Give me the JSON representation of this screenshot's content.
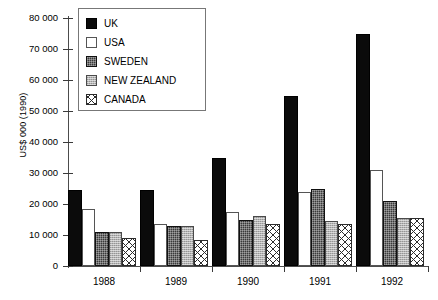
{
  "chart_data": {
    "type": "bar",
    "title": "",
    "xlabel": "",
    "ylabel": "US$ 000 (1990)",
    "categories": [
      "1988",
      "1989",
      "1990",
      "1991",
      "1992"
    ],
    "ylim": [
      0,
      80000
    ],
    "ytick_values": [
      0,
      10000,
      20000,
      30000,
      40000,
      50000,
      60000,
      70000,
      80000
    ],
    "ytick_labels": [
      "0",
      "10 000",
      "20 000",
      "30 000",
      "40 000",
      "50 000",
      "60 000",
      "70 000",
      "80 000"
    ],
    "grid": false,
    "legend_position": "upper-left-inside",
    "series": [
      {
        "name": "UK",
        "swatch": "solid-black",
        "color": "#0b0b0b",
        "values": [
          24500,
          24500,
          35000,
          55000,
          75000
        ]
      },
      {
        "name": "USA",
        "swatch": "solid-white",
        "color": "#ffffff",
        "values": [
          18500,
          13500,
          17500,
          24000,
          31000
        ]
      },
      {
        "name": "SWEDEN",
        "swatch": "dark-textured",
        "color": "#3a3a3a",
        "values": [
          11000,
          13000,
          15000,
          25000,
          21000
        ]
      },
      {
        "name": "NEW ZEALAND",
        "swatch": "light-gray",
        "color": "#b4b4b4",
        "values": [
          11000,
          13000,
          16000,
          14500,
          15500
        ]
      },
      {
        "name": "CANADA",
        "swatch": "crosshatch",
        "color": "#ffffff",
        "values": [
          9000,
          8500,
          13500,
          13500,
          15500
        ]
      }
    ]
  }
}
